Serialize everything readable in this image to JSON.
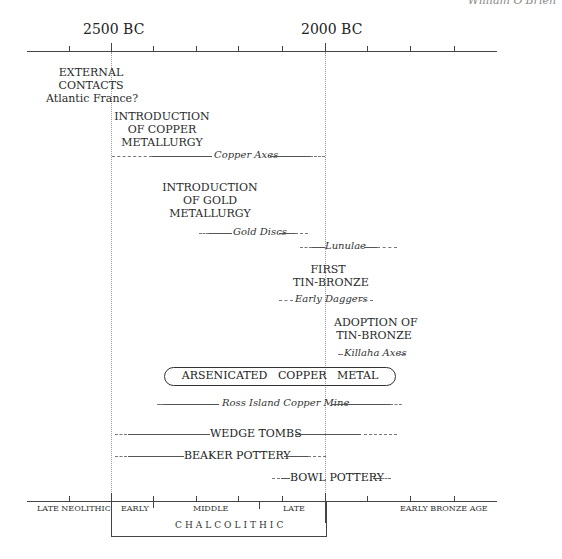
{
  "author": "William O'Brien",
  "top_axis": {
    "labels": [
      "2500 BC",
      "2000 BC"
    ]
  },
  "events": {
    "external_contacts": [
      "EXTERNAL",
      "CONTACTS",
      "Atlantic France?"
    ],
    "copper_metallurgy": [
      "INTRODUCTION",
      "OF COPPER",
      "METALLURGY"
    ],
    "copper_axes": "Copper Axes",
    "gold_metallurgy": [
      "INTRODUCTION",
      "OF GOLD",
      "METALLURGY"
    ],
    "gold_discs": "Gold Discs",
    "lunulae": "Lunulae",
    "first_tin_bronze": [
      "FIRST",
      "TIN-BRONZE"
    ],
    "early_daggers": "Early Daggers",
    "adoption_tin_bronze": [
      "ADOPTION OF",
      "TIN-BRONZE"
    ],
    "killaha_axes": "Killaha Axes",
    "arsenicated": "ARSENICATED   COPPER   METAL",
    "ross_island": "Ross Island Copper Mine",
    "wedge_tombs": "WEDGE TOMBS",
    "beaker_pottery": "BEAKER POTTERY",
    "bowl_pottery": "BOWL POTTERY"
  },
  "bottom_axis": {
    "periods": [
      "LATE NEOLITHIC",
      "EARLY",
      "MIDDLE",
      "LATE",
      "EARLY BRONZE AGE"
    ],
    "chalcolithic": "CHALCOLITHIC"
  }
}
